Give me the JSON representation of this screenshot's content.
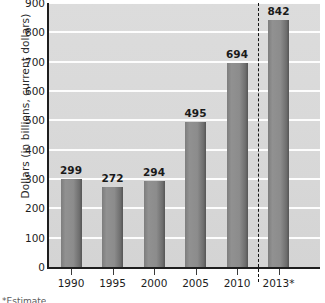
{
  "chart_data": {
    "type": "bar",
    "title": "",
    "subtitle": "",
    "xlabel": "",
    "ylabel": "Dollars (in billions, current dollars)",
    "categories": [
      "1990",
      "1995",
      "2000",
      "2005",
      "2010",
      "2013*"
    ],
    "values": [
      299,
      272,
      294,
      495,
      694,
      842
    ],
    "value_labels": [
      "299",
      "272",
      "294",
      "495",
      "694",
      "842"
    ],
    "ylim": [
      0,
      900
    ],
    "yticks": [
      0,
      100,
      200,
      300,
      400,
      500,
      600,
      700,
      800,
      900
    ],
    "ytick_labels": [
      "0",
      "100",
      "200",
      "300",
      "400",
      "500",
      "600",
      "700",
      "800",
      "900"
    ],
    "grid": true,
    "grid_axis": "y",
    "legend": null,
    "annotations": [
      {
        "name": "forecast-divider",
        "type": "vertical-dashed-line",
        "between": [
          "2010",
          "2013*"
        ],
        "note": "separates actual data from projected/estimated 2013 value"
      },
      {
        "name": "estimate-asterisk",
        "type": "text-marker",
        "text": "*",
        "attached_to": "2013*"
      }
    ],
    "colors": {
      "bar_fill": "#8a8a8a",
      "bar_edge": "#5a5a5a",
      "plot_background": "#d9d9d9",
      "gridline": "#ffffff",
      "axis": "#1e1e1e",
      "text": "#1d1d1d",
      "divider": "#111111"
    }
  },
  "footnote": {
    "clipped_text": "*Estimate"
  }
}
